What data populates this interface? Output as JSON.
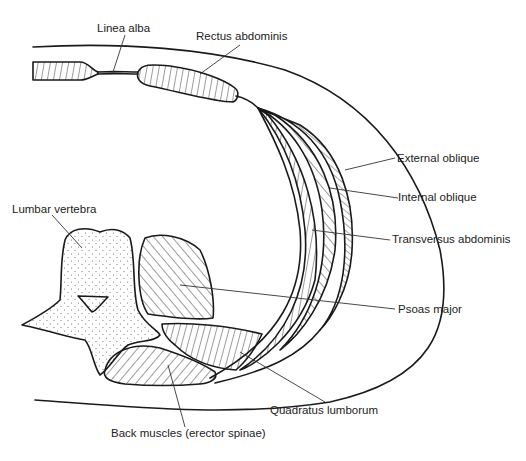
{
  "diagram": {
    "labels": [
      {
        "id": "linea_alba",
        "text": "Linea alba"
      },
      {
        "id": "rectus_abdominis",
        "text": "Rectus abdominis"
      },
      {
        "id": "external_oblique",
        "text": "External oblique"
      },
      {
        "id": "internal_oblique",
        "text": "Internal oblique"
      },
      {
        "id": "transversus_abdominis",
        "text": "Transversus abdominis"
      },
      {
        "id": "lumbar_vertebra",
        "text": "Lumbar vertebra"
      },
      {
        "id": "psoas_major",
        "text": "Psoas major"
      },
      {
        "id": "quadratus_lumborum",
        "text": "Quadratus lumborum"
      },
      {
        "id": "back_muscles",
        "text": "Back muscles (erector spinae)"
      }
    ],
    "colors": {
      "ink": "#1a1a1a",
      "background": "#ffffff"
    }
  }
}
